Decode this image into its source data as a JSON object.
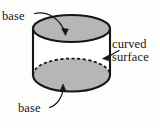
{
  "figure": {
    "shape": "cylinder",
    "colors": {
      "background": "#fdfdfb",
      "face_fill": "#b6b6b6",
      "body_fill": "#ffffff",
      "outline": "#161616",
      "text": "#171717",
      "leader": "#161616"
    },
    "geometry": {
      "top_ellipse": {
        "cx": 71.5,
        "cy": 28.5,
        "rx": 38.5,
        "ry": 13.5
      },
      "bottom_ellipse": {
        "cx": 71.5,
        "cy": 75.0,
        "rx": 38.5,
        "ry": 16.5
      },
      "wall_left_x": 33.0,
      "wall_right_x": 110.0,
      "outline_width": 2.0,
      "dashed_arc": "bottom-ellipse-rear-upper-arc"
    }
  },
  "labels": {
    "base_top": "base",
    "curved_surface_line1": "curved",
    "curved_surface_line2": "surface",
    "base_bottom": "base"
  },
  "annotations": [
    {
      "id": "leader-base-top",
      "label": "base",
      "from": {
        "x": 34,
        "y": 13
      },
      "to": {
        "x": 64,
        "y": 34
      },
      "arrowhead": "to",
      "style": "curved"
    },
    {
      "id": "leader-curved-surface",
      "label": "curved surface",
      "from": {
        "x": 118,
        "y": 52
      },
      "to": {
        "x": 104,
        "y": 58
      },
      "arrowhead": "to",
      "style": "curved"
    },
    {
      "id": "leader-base-bottom",
      "label": "base",
      "from": {
        "x": 49,
        "y": 108
      },
      "to": {
        "x": 63,
        "y": 84
      },
      "arrowhead": "to",
      "style": "curved"
    }
  ]
}
